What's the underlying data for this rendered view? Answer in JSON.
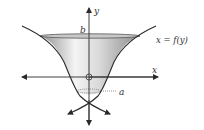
{
  "figure": {
    "axis_labels": {
      "x": "x",
      "y": "y"
    },
    "curve_label": "x = f(y)",
    "upper_bound_label": "b",
    "lower_bound_label": "a",
    "origin_marker": "circle",
    "colors": {
      "stroke": "#2a2a2a",
      "surface_dark": "#9a9a9a",
      "surface_light": "#f2f2f2",
      "rim": "#b5b5b5"
    }
  }
}
